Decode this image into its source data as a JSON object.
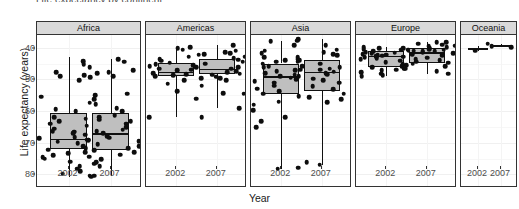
{
  "chart": {
    "title_cut_off": "Life expectancy by continent",
    "ylabel": "Life expectancy (years)",
    "xlabel": "Year",
    "y_ticks": [
      "80",
      "70",
      "60",
      "50",
      "40"
    ],
    "x_ticks": [
      "2002",
      "2007"
    ],
    "facets": [
      "Africa",
      "Americas",
      "Asia",
      "Europe",
      "Oceania"
    ]
  },
  "chart_data": {
    "type": "boxplot",
    "title": "Life expectancy by continent",
    "xlabel": "Year",
    "ylabel": "Life expectancy (years)",
    "ylim": [
      36,
      84
    ],
    "y_tick_values": [
      40,
      50,
      60,
      70,
      80
    ],
    "x_categories": [
      "2002",
      "2007"
    ],
    "facet_variable": "continent",
    "facets": [
      "Africa",
      "Americas",
      "Asia",
      "Europe",
      "Oceania"
    ],
    "grid": "faint-horizontal-and-vertical",
    "legend": "none",
    "overlay": "jittered points over boxplots",
    "box_fill": "#bfbfbf",
    "box_line": "#111111",
    "point_color": "#0d0d0d",
    "strip_fill": "#d9d9d9",
    "panel_fill": "#ffffff",
    "groups": [
      {
        "facet": "Africa",
        "x": "2002",
        "min": 39.2,
        "q1": 48.0,
        "median": 51.2,
        "q3": 59.5,
        "max": 77.0,
        "points": [
          71.3,
          70.9,
          75.7,
          74.8,
          72.3,
          69.8,
          64.5,
          62.6,
          60.6,
          60.0,
          58.0,
          57.6,
          56.7,
          56.0,
          54.4,
          53.7,
          53.4,
          52.9,
          51.8,
          51.5,
          51.0,
          50.7,
          50.3,
          49.8,
          48.9,
          48.3,
          47.8,
          47.0,
          46.6,
          46.0,
          45.5,
          44.9,
          44.0,
          43.4,
          42.6,
          41.8,
          41.0,
          40.2,
          39.6,
          39.2
        ]
      },
      {
        "facet": "Africa",
        "x": "2007",
        "min": 39.6,
        "q1": 47.8,
        "median": 52.9,
        "q3": 59.4,
        "max": 76.4,
        "points": [
          76.4,
          75.6,
          73.9,
          72.8,
          72.3,
          71.9,
          71.0,
          70.6,
          65.5,
          64.9,
          63.8,
          62.1,
          60.9,
          59.9,
          58.6,
          58.0,
          57.3,
          56.7,
          56.0,
          55.3,
          54.8,
          54.1,
          53.6,
          53.0,
          52.5,
          52.0,
          51.6,
          50.9,
          50.4,
          49.6,
          48.8,
          48.3,
          47.6,
          46.9,
          46.2,
          45.6,
          44.7,
          43.8,
          42.6,
          39.6
        ]
      },
      {
        "facet": "Americas",
        "x": "2002",
        "min": 58.1,
        "q1": 70.9,
        "median": 72.4,
        "q3": 75.3,
        "max": 79.8,
        "points": [
          79.8,
          79.3,
          77.8,
          77.2,
          76.4,
          75.9,
          75.3,
          74.8,
          74.2,
          73.9,
          73.4,
          72.9,
          72.4,
          72.0,
          71.7,
          71.3,
          70.9,
          70.3,
          69.8,
          68.6,
          68.0,
          66.2,
          63.9,
          58.1,
          58.1
        ]
      },
      {
        "facet": "Americas",
        "x": "2007",
        "min": 60.9,
        "q1": 71.8,
        "median": 73.4,
        "q3": 76.4,
        "max": 80.7,
        "points": [
          80.7,
          80.2,
          79.0,
          78.6,
          78.3,
          77.9,
          77.2,
          76.6,
          76.2,
          75.6,
          75.0,
          74.4,
          73.9,
          73.4,
          73.0,
          72.6,
          72.2,
          71.8,
          71.4,
          70.8,
          70.3,
          69.8,
          65.6,
          65.5,
          60.9
        ]
      },
      {
        "facet": "Asia",
        "x": "2002",
        "min": 41.8,
        "q1": 65.4,
        "median": 71.0,
        "q3": 75.0,
        "max": 82.0,
        "points": [
          82.0,
          80.7,
          79.0,
          78.3,
          76.9,
          76.1,
          75.6,
          75.0,
          74.2,
          73.8,
          73.0,
          72.5,
          72.0,
          71.5,
          71.0,
          70.5,
          70.0,
          69.5,
          68.9,
          68.0,
          67.1,
          66.2,
          65.4,
          64.3,
          63.0,
          62.0,
          60.3,
          58.1,
          56.8,
          54.8,
          42.1,
          41.8
        ]
      },
      {
        "facet": "Asia",
        "x": "2007",
        "min": 43.0,
        "q1": 66.2,
        "median": 72.4,
        "q3": 76.0,
        "max": 82.6,
        "points": [
          82.6,
          82.2,
          80.7,
          79.4,
          78.6,
          78.0,
          77.6,
          76.9,
          76.4,
          76.0,
          75.6,
          75.0,
          74.2,
          73.9,
          73.4,
          73.0,
          72.8,
          72.4,
          72.0,
          71.7,
          71.0,
          70.2,
          69.8,
          69.0,
          67.8,
          66.8,
          65.5,
          64.7,
          63.8,
          62.7,
          43.8,
          43.0
        ]
      },
      {
        "facet": "Europe",
        "x": "2002",
        "min": 71.0,
        "q1": 73.9,
        "median": 77.5,
        "q3": 79.0,
        "max": 80.2,
        "points": [
          80.2,
          79.8,
          79.6,
          79.4,
          79.1,
          78.9,
          78.6,
          78.4,
          78.2,
          78.0,
          77.8,
          77.6,
          77.5,
          77.3,
          77.0,
          76.7,
          76.4,
          75.9,
          75.4,
          74.9,
          74.5,
          74.1,
          73.8,
          73.3,
          72.8,
          72.3,
          71.8,
          71.3,
          71.0,
          73.0
        ]
      },
      {
        "facet": "Europe",
        "x": "2007",
        "min": 71.8,
        "q1": 75.3,
        "median": 78.6,
        "q3": 79.8,
        "max": 81.8,
        "points": [
          81.8,
          81.7,
          81.2,
          80.9,
          80.6,
          80.5,
          80.2,
          80.0,
          79.8,
          79.6,
          79.4,
          79.3,
          79.1,
          78.9,
          78.8,
          78.6,
          78.3,
          78.0,
          77.7,
          77.2,
          76.8,
          76.4,
          76.0,
          75.6,
          75.2,
          74.8,
          74.2,
          73.3,
          72.5,
          71.8
        ]
      },
      {
        "facet": "Oceania",
        "x": "2002",
        "min": 79.1,
        "q1": 79.4,
        "median": 79.7,
        "q3": 80.0,
        "max": 80.4,
        "points": [
          79.1,
          80.4
        ]
      },
      {
        "facet": "Oceania",
        "x": "2007",
        "min": 80.2,
        "q1": 80.5,
        "median": 80.7,
        "q3": 81.0,
        "max": 81.2,
        "points": [
          80.2,
          81.2
        ]
      }
    ]
  }
}
